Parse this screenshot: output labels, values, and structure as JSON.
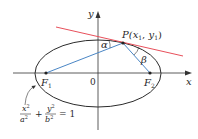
{
  "diagram": {
    "type": "ellipse-reflection-property",
    "axes": {
      "x_label": "x",
      "y_label": "y",
      "origin_label": "0"
    },
    "ellipse": {
      "equation": {
        "x_num": "x",
        "x_num_exp": "2",
        "x_den": "a",
        "x_den_exp": "2",
        "plus": "+",
        "y_num": "y",
        "y_num_exp": "2",
        "y_den": "b",
        "y_den_exp": "2",
        "equals": "= 1"
      },
      "stroke_color": "#2b2b2b"
    },
    "foci": [
      {
        "label": "F",
        "subscript": "1"
      },
      {
        "label": "F",
        "subscript": "2"
      }
    ],
    "point": {
      "label_prefix": "P(",
      "x_var": "x",
      "x_sub": "1",
      "sep": ", ",
      "y_var": "y",
      "y_sub": "1",
      "label_suffix": ")"
    },
    "angles": {
      "alpha": "α",
      "beta": "β"
    },
    "colors": {
      "tangent_line": "#e8505b",
      "focal_lines": "#4a86c5",
      "axes": "#333333"
    }
  }
}
